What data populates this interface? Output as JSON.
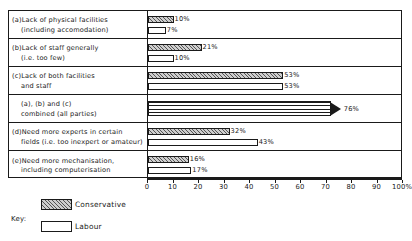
{
  "chart_data": {
    "type": "bar",
    "orientation": "horizontal",
    "title": "",
    "xlabel": "",
    "ylabel": "",
    "xlim": [
      0,
      100
    ],
    "grid": false,
    "legend_position": "bottom-left",
    "axis": {
      "ticks": [
        0,
        10,
        20,
        30,
        40,
        50,
        60,
        70,
        80,
        90,
        100
      ],
      "tick_labels": [
        "0",
        "10",
        "20",
        "30",
        "40",
        "50",
        "60",
        "70",
        "80",
        "90",
        "100%"
      ]
    },
    "legend": {
      "key_label": "Key:",
      "entries": [
        {
          "name": "Conservative",
          "pattern": "diagonal-hatch"
        },
        {
          "name": "Labour",
          "pattern": "white-fill"
        }
      ]
    },
    "series": [
      {
        "name": "Conservative",
        "values": [
          10,
          21,
          53,
          null,
          32,
          16
        ]
      },
      {
        "name": "Labour",
        "values": [
          7,
          10,
          53,
          null,
          43,
          17
        ]
      }
    ],
    "categories": [
      "(a)Lack of physical facilities (including accomodation)",
      "(b)Lack of staff generally (i.e. too few)",
      "(c)Lack of both facilities and staff",
      "(a), (b) and (c) combined (all parties)",
      "(d)Need more experts in certain fields (i.e. too inexpert or amateur)",
      "(e)Need more mechanisation, including computerisation"
    ],
    "rows": [
      {
        "label_line1": "(a)Lack of physical facilities",
        "label_line2": "(including accomodation)",
        "bars": [
          {
            "party": "Conservative",
            "value": 10,
            "value_label": "10%"
          },
          {
            "party": "Labour",
            "value": 7,
            "value_label": "7%"
          }
        ]
      },
      {
        "label_line1": "(b)Lack of staff generally",
        "label_line2": "(i.e. too few)",
        "bars": [
          {
            "party": "Conservative",
            "value": 21,
            "value_label": "21%"
          },
          {
            "party": "Labour",
            "value": 10,
            "value_label": "10%"
          }
        ]
      },
      {
        "label_line1": "(c)Lack of both facilities",
        "label_line2": "and staff",
        "bars": [
          {
            "party": "Conservative",
            "value": 53,
            "value_label": "53%"
          },
          {
            "party": "Labour",
            "value": 53,
            "value_label": "53%"
          }
        ]
      },
      {
        "label_line1": "(a), (b) and (c)",
        "label_line2": "combined (all parties)",
        "bars": [
          {
            "party": "All parties",
            "value": 76,
            "value_label": "76%"
          }
        ]
      },
      {
        "label_line1": "(d)Need more experts in certain",
        "label_line2": "fields (i.e. too inexpert or amateur)",
        "bars": [
          {
            "party": "Conservative",
            "value": 32,
            "value_label": "32%"
          },
          {
            "party": "Labour",
            "value": 43,
            "value_label": "43%"
          }
        ]
      },
      {
        "label_line1": "(e)Need more mechanisation,",
        "label_line2": "including computerisation",
        "bars": [
          {
            "party": "Conservative",
            "value": 16,
            "value_label": "16%"
          },
          {
            "party": "Labour",
            "value": 17,
            "value_label": "17%"
          }
        ]
      }
    ]
  }
}
